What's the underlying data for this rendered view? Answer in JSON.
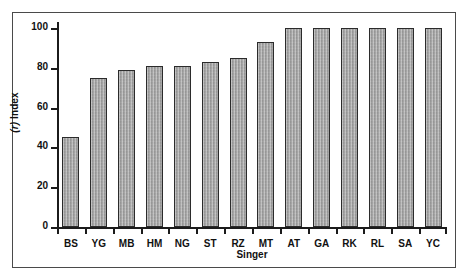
{
  "chart_data": {
    "type": "bar",
    "title": "",
    "subtitle": "",
    "xlabel": "Singer",
    "ylabel": "(r) Index",
    "ylabel_italic_part": "(r)",
    "ylabel_plain_part": " Index",
    "categories": [
      "BS",
      "YG",
      "MB",
      "HM",
      "NG",
      "ST",
      "RZ",
      "MT",
      "AT",
      "GA",
      "RK",
      "RL",
      "SA",
      "YC"
    ],
    "values": [
      45,
      75,
      79,
      81,
      81,
      83,
      85,
      93,
      100,
      100,
      100,
      100,
      100,
      100
    ],
    "ylim": [
      0,
      100
    ],
    "yticks": [
      0,
      20,
      40,
      60,
      80,
      100
    ],
    "ytick_labels": [
      "0",
      "20",
      "40",
      "60",
      "80",
      "100"
    ],
    "grid": false,
    "legend": null,
    "legend_position": "none",
    "bar_fill_color": "#a9a9a9",
    "bar_edge_color": "#2b2b2b",
    "axis_color": "#1b1b1b",
    "frame_color": "#4a4a4a",
    "background_color": "#ffffff",
    "annotations": []
  }
}
